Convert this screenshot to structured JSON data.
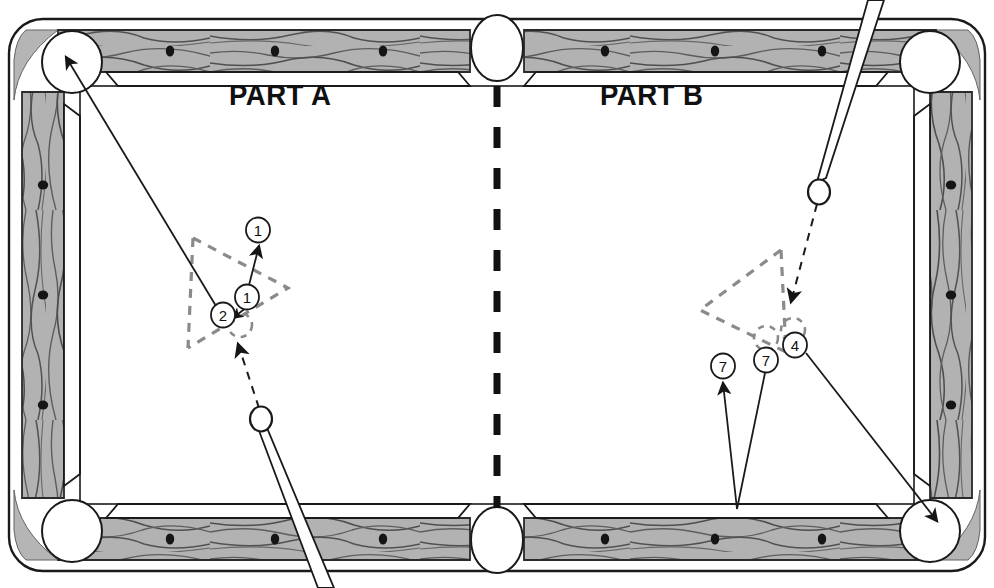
{
  "diagram": {
    "type": "billiards-table-diagram",
    "width": 994,
    "height": 588
  },
  "labels": {
    "part_a": "PART A",
    "part_b": "PART B"
  },
  "colors": {
    "rail_wood": "#b0b0b0",
    "rail_wood_dark": "#9a9a9a",
    "cloth": "#ffffff",
    "outline": "#1a1a1a",
    "ghost_dashed": "#808080",
    "ball_fill": "#ffffff",
    "diamond": "#151515",
    "cue_stick": "#ffffff",
    "divider": "#111111"
  },
  "table": {
    "pockets": [
      {
        "name": "corner-pocket-top-left",
        "cx": 72,
        "cy": 62,
        "r": 30,
        "kind": "corner"
      },
      {
        "name": "side-pocket-top",
        "cx": 497,
        "cy": 48,
        "r": 26,
        "kind": "side"
      },
      {
        "name": "corner-pocket-top-right",
        "cx": 930,
        "cy": 62,
        "r": 30,
        "kind": "corner"
      },
      {
        "name": "corner-pocket-bottom-left",
        "cx": 72,
        "cy": 531,
        "r": 30,
        "kind": "corner"
      },
      {
        "name": "side-pocket-bottom",
        "cx": 497,
        "cy": 540,
        "r": 26,
        "kind": "side"
      },
      {
        "name": "corner-pocket-bottom-right",
        "cx": 930,
        "cy": 531,
        "r": 30,
        "kind": "corner"
      }
    ],
    "diamonds_top": [
      170,
      275,
      383,
      605,
      715,
      822
    ],
    "diamonds_bottom": [
      170,
      275,
      383,
      605,
      715,
      822
    ],
    "diamonds_left": [
      185,
      295,
      405
    ],
    "diamonds_right": [
      185,
      295,
      405
    ],
    "center_divider": {
      "x": 497,
      "y_top": 86,
      "y_bottom": 508,
      "dash": "20 18",
      "width": 7
    }
  },
  "part_a": {
    "name": "PART A",
    "rack_triangle": [
      [
        193,
        238
      ],
      [
        288,
        288
      ],
      [
        188,
        348
      ]
    ],
    "balls": [
      {
        "id": "ball-1-final",
        "label": "1",
        "cx": 258,
        "cy": 230,
        "r": 12,
        "state": "after-contact"
      },
      {
        "id": "ball-1-start",
        "label": "1",
        "cx": 247,
        "cy": 297,
        "r": 12,
        "state": "at-rack"
      },
      {
        "id": "ball-2",
        "label": "2",
        "cx": 223,
        "cy": 315,
        "r": 12,
        "state": "at-rack"
      }
    ],
    "cue_ball": {
      "name": "cue-ball",
      "cx": 261,
      "cy": 419,
      "r": 11
    },
    "cue_stick": {
      "tip_x": 262,
      "tip_y": 430,
      "butt_x": 330,
      "butt_y": 588,
      "width": 7
    },
    "paths": [
      {
        "name": "cue-ball-path",
        "style": "dashed",
        "from": [
          258,
          408
        ],
        "to": [
          238,
          343
        ],
        "arrow": true
      },
      {
        "name": "ball-2-path-to-pocket",
        "style": "solid",
        "from": [
          216,
          305
        ],
        "to": [
          63,
          55
        ],
        "arrow": true
      },
      {
        "name": "ball-1-travel-path",
        "style": "solid",
        "from": [
          249,
          288
        ],
        "to": [
          259,
          245
        ],
        "arrow": true
      },
      {
        "name": "contact-arrow",
        "style": "solid-short",
        "from": [
          243,
          309
        ],
        "to": [
          231,
          318
        ],
        "arrow": true
      }
    ]
  },
  "part_b": {
    "name": "PART B",
    "rack_triangle": [
      [
        778,
        248
      ],
      [
        700,
        310
      ],
      [
        785,
        352
      ]
    ],
    "balls": [
      {
        "id": "ball-7-left",
        "label": "7",
        "cx": 723,
        "cy": 366,
        "r": 12,
        "state": "after-contact"
      },
      {
        "id": "ball-7-rack",
        "label": "7",
        "cx": 766,
        "cy": 360,
        "r": 12,
        "state": "at-rack"
      },
      {
        "id": "ball-4",
        "label": "4",
        "cx": 795,
        "cy": 345,
        "r": 12,
        "state": "at-rack"
      }
    ],
    "cue_ball": {
      "name": "cue-ball",
      "cx": 819,
      "cy": 192,
      "r": 11
    },
    "cue_stick": {
      "tip_x": 823,
      "tip_y": 183,
      "butt_x": 879,
      "butt_y": 0,
      "width": 7
    },
    "paths": [
      {
        "name": "cue-ball-path",
        "style": "dashed",
        "from": [
          817,
          203
        ],
        "to": [
          793,
          300
        ],
        "arrow": true
      },
      {
        "name": "ball-7-rebound-down",
        "style": "solid",
        "from": [
          762,
          372
        ],
        "to": [
          736,
          508
        ],
        "arrow": false
      },
      {
        "name": "ball-7-rebound-up",
        "style": "solid",
        "from": [
          736,
          508
        ],
        "to": [
          722,
          382
        ],
        "arrow": true
      },
      {
        "name": "ball-4-path-to-pocket",
        "style": "solid",
        "from": [
          806,
          352
        ],
        "to": [
          938,
          521
        ],
        "arrow": true
      }
    ]
  }
}
